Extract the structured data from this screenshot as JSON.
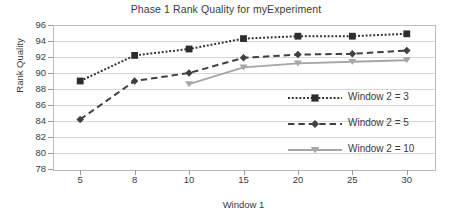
{
  "chart_data": {
    "type": "line",
    "title": "Phase 1 Rank Quality for myExperiment",
    "xlabel": "Window 1",
    "ylabel": "Rank Quality",
    "categories": [
      "5",
      "8",
      "10",
      "15",
      "20",
      "25",
      "30"
    ],
    "ylim": [
      78,
      96
    ],
    "yticks": [
      "78",
      "80",
      "82",
      "84",
      "86",
      "88",
      "90",
      "92",
      "94",
      "96"
    ],
    "grid": true,
    "legend_position": "inside-right",
    "series": [
      {
        "name": "Window 2 = 3",
        "values": [
          89.0,
          92.2,
          93.0,
          94.3,
          94.6,
          94.6,
          94.9
        ],
        "color": "#2d2d2d",
        "line_style": "dotted",
        "marker": "square"
      },
      {
        "name": "Window 2 = 5",
        "values": [
          84.2,
          89.0,
          90.0,
          91.9,
          92.3,
          92.4,
          92.8
        ],
        "color": "#404040",
        "line_style": "dashed",
        "marker": "diamond"
      },
      {
        "name": "Window 2 = 10",
        "values": [
          null,
          null,
          88.6,
          90.7,
          91.2,
          91.4,
          91.6
        ],
        "color": "#a6a6a6",
        "line_style": "solid",
        "marker": "triangle"
      }
    ]
  },
  "legend": {
    "items": [
      {
        "label": "Window 2 = 3"
      },
      {
        "label": "Window 2 = 5"
      },
      {
        "label": "Window 2 = 10"
      }
    ]
  },
  "axis_colors": {
    "frame": "#bcbcbc",
    "gridline": "#d6d6d6",
    "text": "#3b3b3b"
  }
}
